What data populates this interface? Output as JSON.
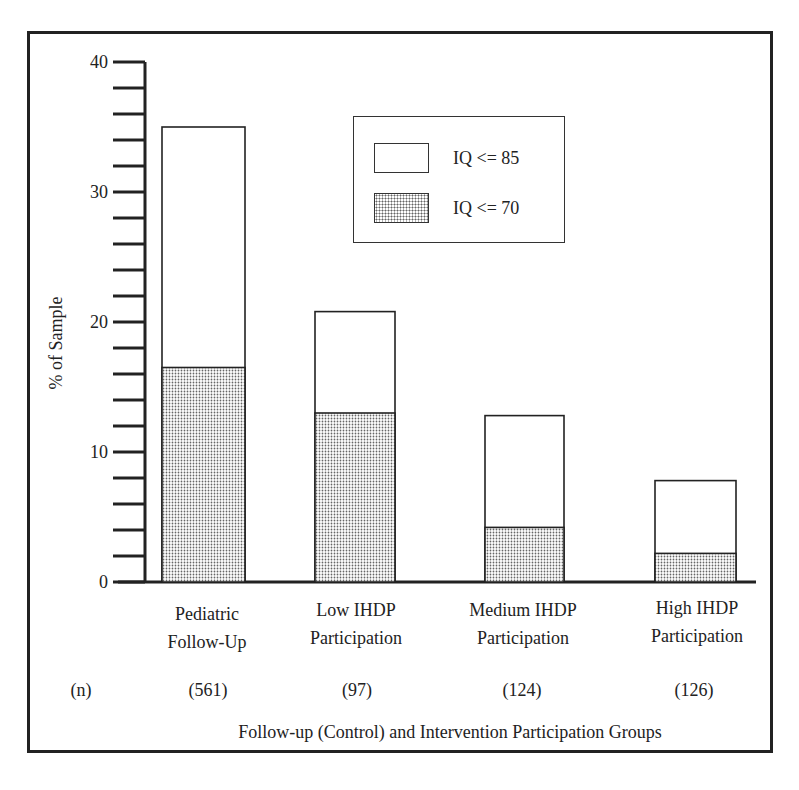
{
  "chart_data": {
    "type": "bar",
    "stacked": "overlay",
    "title": "",
    "xlabel": "Follow-up (Control) and Intervention Participation Groups",
    "ylabel": "% of Sample",
    "ylim": [
      0,
      40
    ],
    "yticks_major": [
      0,
      10,
      20,
      30,
      40
    ],
    "ytick_minor_step": 2,
    "grid": false,
    "legend_position": "upper center",
    "categories": [
      "Pediatric Follow-Up",
      "Low IHDP Participation",
      "Medium IHDP Participation",
      "High IHDP Participation"
    ],
    "n_label": "(n)",
    "n": [
      "(561)",
      "(97)",
      "(124)",
      "(126)"
    ],
    "series": [
      {
        "name": "IQ <= 85",
        "fill": "white",
        "values": [
          35.0,
          20.8,
          12.8,
          7.8
        ]
      },
      {
        "name": "IQ <= 70",
        "fill": "stippled",
        "values": [
          16.5,
          13.0,
          4.2,
          2.2
        ]
      }
    ]
  },
  "labels": {
    "y_ticks": [
      "0",
      "10",
      "20",
      "30",
      "40"
    ],
    "categories_line1": [
      "Pediatric",
      "Low IHDP",
      "Medium IHDP",
      "High IHDP"
    ],
    "categories_line2": [
      "Follow-Up",
      "Participation",
      "Participation",
      "Participation"
    ],
    "n_label": "(n)",
    "n_values": [
      "(561)",
      "(97)",
      "(124)",
      "(126)"
    ],
    "xlabel": "Follow-up (Control) and Intervention Participation Groups",
    "ylabel": "% of Sample",
    "legend": [
      "IQ <= 85",
      "IQ <= 70"
    ]
  },
  "colors": {
    "line": "#222222",
    "stipple_dot": "#666666",
    "background": "#ffffff"
  }
}
